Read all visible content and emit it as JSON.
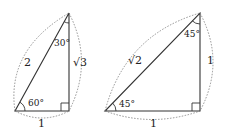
{
  "diagram": {
    "triangles": [
      {
        "name": "30-60-90",
        "hypotenuse": "2",
        "base": "1",
        "height": "√3",
        "angle_bottom": "60°",
        "angle_top": "30°"
      },
      {
        "name": "45-45-90",
        "hypotenuse": "√2",
        "base": "1",
        "height": "1",
        "angle_bottom": "45°",
        "angle_top": "45°"
      }
    ],
    "colors": {
      "line": "#333333",
      "dotted": "#777777"
    }
  }
}
